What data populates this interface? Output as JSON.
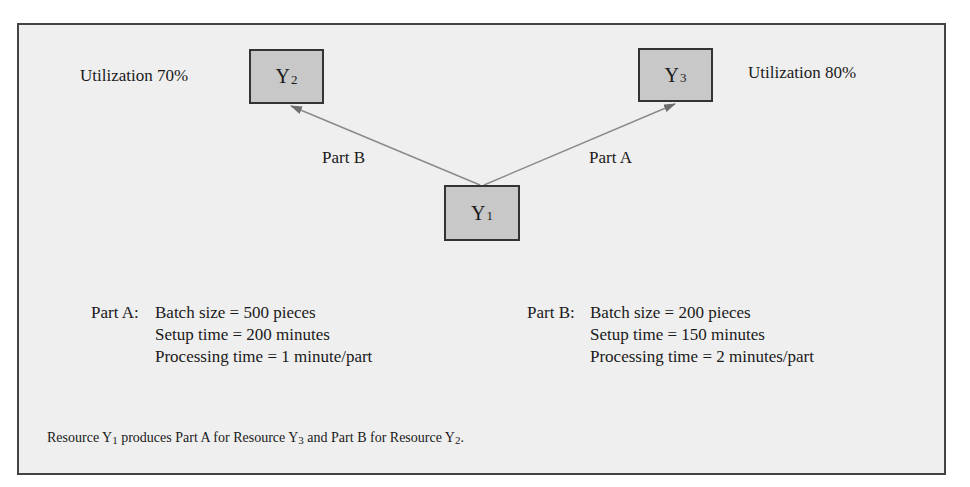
{
  "diagram": {
    "nodes": [
      {
        "id": "Y1",
        "letter": "Y",
        "subscript": "1"
      },
      {
        "id": "Y2",
        "letter": "Y",
        "subscript": "2"
      },
      {
        "id": "Y3",
        "letter": "Y",
        "subscript": "3"
      }
    ],
    "utilization": {
      "y2": "Utilization 70%",
      "y3": "Utilization 80%"
    },
    "edges": [
      {
        "from": "Y1",
        "to": "Y2",
        "label": "Part B"
      },
      {
        "from": "Y1",
        "to": "Y3",
        "label": "Part A"
      }
    ],
    "colors": {
      "background": "#efefef",
      "node_fill": "#c8c8c8",
      "border": "#444444",
      "arrow": "#7a7a7a"
    }
  },
  "parts": {
    "a": {
      "label": "Part A:",
      "lines": [
        "Batch size = 500 pieces",
        "Setup time = 200 minutes",
        "Processing time = 1 minute/part"
      ]
    },
    "b": {
      "label": "Part B:",
      "lines": [
        "Batch size = 200 pieces",
        "Setup time = 150 minutes",
        "Processing time = 2 minutes/part"
      ]
    }
  },
  "caption": {
    "t1": "Resource Y",
    "s1": "1",
    "t2": " produces Part A for Resource Y",
    "s2": "3",
    "t3": " and Part B for Resource Y",
    "s3": "2",
    "t4": "."
  }
}
